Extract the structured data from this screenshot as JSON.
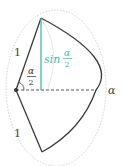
{
  "diagram": {
    "labels": {
      "side_top": "1",
      "side_bottom": "1",
      "half_angle_num": "α",
      "half_angle_den": "2",
      "sine_prefix": "sin",
      "sine_num": "α",
      "sine_den": "2",
      "arc_angle": "α"
    },
    "colors": {
      "stroke": "#3a3a3a",
      "sine": "#3fb8ad",
      "dotted": "#b8b8b8",
      "dashed": "#555555"
    }
  }
}
